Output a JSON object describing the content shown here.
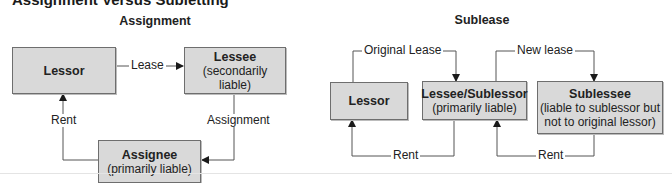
{
  "title": "Assignment Versus Subletting",
  "colors": {
    "box_fill": "#d9d9d9",
    "box_border": "#6e6e6e",
    "line": "#555555"
  },
  "assignment": {
    "heading": "Assignment",
    "boxes": {
      "lessor": {
        "title": "Lessor",
        "subtitle": ""
      },
      "lessee": {
        "title": "Lessee",
        "subtitle": "(secondarily liable)"
      },
      "assignee": {
        "title": "Assignee",
        "subtitle": "(primarily liable)"
      }
    },
    "edges": {
      "lease": "Lease",
      "assignment": "Assignment",
      "rent": "Rent"
    }
  },
  "sublease": {
    "heading": "Sublease",
    "boxes": {
      "lessor": {
        "title": "Lessor",
        "subtitle": ""
      },
      "sublessor": {
        "title": "Lessee/Sublessor",
        "subtitle": "(primarily liable)"
      },
      "sublessee": {
        "title": "Sublessee",
        "subtitle_line1": "(liable to sublessor but",
        "subtitle_line2": "not to original lessor)"
      }
    },
    "edges": {
      "original_lease": "Original Lease",
      "new_lease": "New lease",
      "rent_1": "Rent",
      "rent_2": "Rent"
    }
  }
}
